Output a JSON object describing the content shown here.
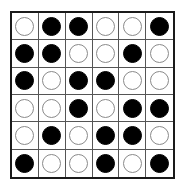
{
  "board": {
    "rows": 6,
    "cols": 6,
    "colors": {
      "black": "#000000",
      "white": "#ffffff",
      "grid": "#1a1a1a"
    },
    "cells": [
      [
        "white",
        "black",
        "black",
        "white",
        "white",
        "black"
      ],
      [
        "black",
        "black",
        "white",
        "white",
        "black",
        "white"
      ],
      [
        "black",
        "white",
        "black",
        "black",
        "white",
        "white"
      ],
      [
        "white",
        "white",
        "black",
        "white",
        "black",
        "black"
      ],
      [
        "white",
        "black",
        "white",
        "black",
        "black",
        "white"
      ],
      [
        "black",
        "white",
        "white",
        "black",
        "white",
        "black"
      ]
    ]
  }
}
